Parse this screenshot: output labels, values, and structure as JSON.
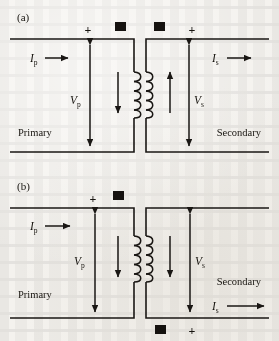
{
  "figure": {
    "background_color": "#f4f2ee",
    "ink_color": "#1a1714",
    "width": 279,
    "height": 341
  },
  "panels": [
    {
      "id": "a",
      "label": "(a)",
      "primary_label": "Primary",
      "secondary_label": "Secondary",
      "primary_current": {
        "symbol": "I",
        "subscript": "p",
        "direction": "right"
      },
      "secondary_current": {
        "symbol": "I",
        "subscript": "s",
        "direction": "right"
      },
      "primary_voltage": {
        "symbol": "V",
        "subscript": "p"
      },
      "secondary_voltage": {
        "symbol": "V",
        "subscript": "s"
      },
      "primary_polarity": "+",
      "secondary_polarity": "+",
      "primary_polarity_position": "top",
      "secondary_polarity_position": "top",
      "dot_markers": [
        {
          "side": "primary",
          "position": "top"
        },
        {
          "side": "secondary",
          "position": "top"
        }
      ],
      "flux_arrows": [
        {
          "side": "primary",
          "direction": "down"
        },
        {
          "side": "secondary",
          "direction": "up"
        }
      ]
    },
    {
      "id": "b",
      "label": "(b)",
      "primary_label": "Primary",
      "secondary_label": "Secondary",
      "primary_current": {
        "symbol": "I",
        "subscript": "p",
        "direction": "right"
      },
      "secondary_current": {
        "symbol": "I",
        "subscript": "s",
        "direction": "right"
      },
      "primary_voltage": {
        "symbol": "V",
        "subscript": "p"
      },
      "secondary_voltage": {
        "symbol": "V",
        "subscript": "s"
      },
      "primary_polarity": "+",
      "secondary_polarity": "+",
      "primary_polarity_position": "top",
      "secondary_polarity_position": "bottom",
      "dot_markers": [
        {
          "side": "primary",
          "position": "top"
        },
        {
          "side": "secondary",
          "position": "bottom"
        }
      ],
      "flux_arrows": [
        {
          "side": "primary",
          "direction": "down"
        },
        {
          "side": "secondary",
          "direction": "down"
        }
      ]
    }
  ]
}
